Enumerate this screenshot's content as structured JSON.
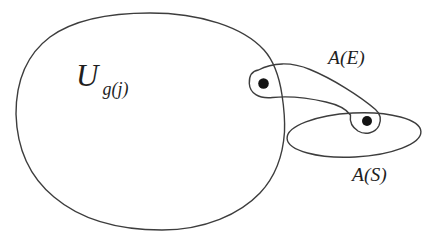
{
  "diagram": {
    "background_color": "#ffffff",
    "line_color": "#3d3d3d",
    "text_color": "#1f1f1f",
    "dot_color": "#141414",
    "labels": {
      "universe_main": "U",
      "universe_sub": "g(j)",
      "set_e": "A(E)",
      "set_s": "A(S)"
    }
  }
}
